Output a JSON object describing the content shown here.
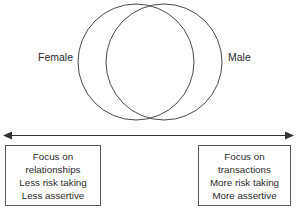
{
  "diagram": {
    "type": "venn-two-circle-with-spectrum",
    "circles": [
      {
        "id": "female",
        "label": "Female",
        "label_position": "left-outside",
        "cx": 136,
        "cy": 62,
        "r": 58,
        "stroke_color": "#4a4a4a",
        "fill": "none"
      },
      {
        "id": "male",
        "label": "Male",
        "label_position": "right-outside",
        "cx": 164,
        "cy": 62,
        "r": 58,
        "stroke_color": "#4a4a4a",
        "fill": "none"
      }
    ],
    "spectrum_axis": {
      "name": "double-headed-arrow",
      "orientation": "horizontal",
      "left_arrow": true,
      "right_arrow": true,
      "color": "#333333"
    },
    "boxes": [
      {
        "id": "female-traits",
        "side": "left",
        "border_color": "#5a5a5a",
        "lines": [
          "Focus on",
          "relationships",
          "Less risk taking",
          "Less assertive"
        ]
      },
      {
        "id": "male-traits",
        "side": "right",
        "border_color": "#5a5a5a",
        "lines": [
          "Focus on",
          "transactions",
          "More risk taking",
          "More assertive"
        ]
      }
    ]
  }
}
